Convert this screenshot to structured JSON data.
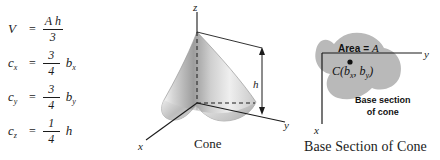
{
  "figure": {
    "formulas": [
      {
        "lhs": "V",
        "lhs_sub": "",
        "numerator": "A h",
        "denominator": "3",
        "tail": ""
      },
      {
        "lhs": "c",
        "lhs_sub": "x",
        "numerator": "3",
        "denominator": "4",
        "tail": "b",
        "tail_sub": "x"
      },
      {
        "lhs": "c",
        "lhs_sub": "y",
        "numerator": "3",
        "denominator": "4",
        "tail": "b",
        "tail_sub": "y"
      },
      {
        "lhs": "c",
        "lhs_sub": "z",
        "numerator": "1",
        "denominator": "4",
        "tail": "h",
        "tail_sub": ""
      }
    ],
    "equals_sign": "=",
    "cone_panel": {
      "caption": "Cone",
      "axis_z": "z",
      "axis_y": "y",
      "axis_x": "x",
      "height_label": "h",
      "surface_color": "#d8d8d8",
      "line_color": "#1b1b1b"
    },
    "base_panel": {
      "caption": "Base Section of Cone",
      "area_prefix": "Area",
      "area_equals": "=",
      "area_symbol": "A",
      "centroid_label_open": "C(",
      "centroid_b": "b",
      "centroid_sub_x": "x",
      "centroid_comma": ", ",
      "centroid_sub_y": "y",
      "centroid_label_close": ")",
      "note_line1": "Base section",
      "note_line2": "of cone",
      "axis_y": "y",
      "axis_x": "x",
      "blob_color": "#b8b8b8"
    }
  }
}
